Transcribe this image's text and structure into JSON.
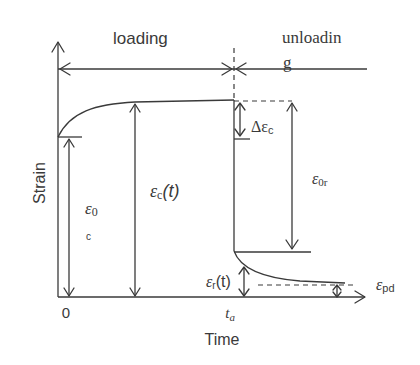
{
  "diagram": {
    "phases": {
      "loading": "loading",
      "unloading_line1": "unloadin",
      "unloading_line2": "g"
    },
    "axes": {
      "y_label": "Strain",
      "x_label": "Time",
      "origin_tick": "0",
      "unload_tick": "t",
      "unload_tick_sub": "a"
    },
    "annotations": {
      "eps0c_main": "ε",
      "eps0c_sub1": "0",
      "eps0c_sub2": "c",
      "epsc_t": "ε",
      "epsc_t_sub": "c",
      "epsc_t_arg": "(t)",
      "delta_epsc": "Δε",
      "delta_epsc_sub": "c",
      "eps0r": "ε",
      "eps0r_sub": "0r",
      "epsr_t": "ε",
      "epsr_t_sub": "r",
      "epsr_t_arg": "(t)",
      "epspd": "ε",
      "epspd_sub": "pd"
    },
    "colors": {
      "ink": "#3a3a3a",
      "background": "#ffffff"
    }
  }
}
